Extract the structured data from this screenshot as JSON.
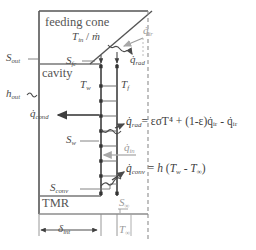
{
  "diagram": {
    "regions": {
      "feeding_cone": "feeding cone",
      "cavity": "cavity",
      "tmr": "TMR"
    },
    "labels": {
      "s_out": {
        "base": "S",
        "sub": "out"
      },
      "h_out": {
        "base": "h",
        "sub": "out"
      },
      "s_fc": {
        "base": "S",
        "sub": "fc"
      },
      "s_w": {
        "base": "S",
        "sub": "w"
      },
      "s_conv": {
        "base": "S",
        "sub": "conv"
      },
      "s_inf": {
        "base": "S",
        "sub": "∞"
      },
      "t_w": {
        "base": "T",
        "sub": "w"
      },
      "t_f": {
        "base": "T",
        "sub": "f"
      },
      "t_inf": {
        "base": "T",
        "sub": "∞"
      },
      "t_in_mdot": {
        "text": "T",
        "sub": "in",
        "sep": " / ",
        "mdot": "ṁ"
      },
      "delta_int": {
        "base": "δ",
        "sub": "int"
      },
      "q_ir": {
        "base": "q̇",
        "sub": "ir"
      },
      "q_rad_cone": {
        "base": "q̇",
        "sub": "rad"
      },
      "q_cond": {
        "base": "q̇",
        "sub": "cond"
      },
      "q_in": {
        "base": "q̇",
        "sub": "in"
      }
    },
    "equations": {
      "radiation": {
        "lhs_base": "q̇",
        "lhs_sub": "rad",
        "rhs": "= εσT⁴ + (1-ε)q̇ᵢᵣ - q̇ᵢᵣ",
        "rhs_plain": "= εσT4 + (1-ε)q̇ir - q̇ir"
      },
      "convection": {
        "lhs_base": "q̇",
        "lhs_sub": "conv",
        "rhs_plain": "= h (Tw - T∞)"
      }
    },
    "colors": {
      "line_dark": "#555555",
      "line_mid": "#6f6f6f",
      "line_faint": "#b0b0b0",
      "text": "#4a4a4a",
      "text_faint": "#9a9a9a",
      "background": "#ffffff"
    }
  }
}
